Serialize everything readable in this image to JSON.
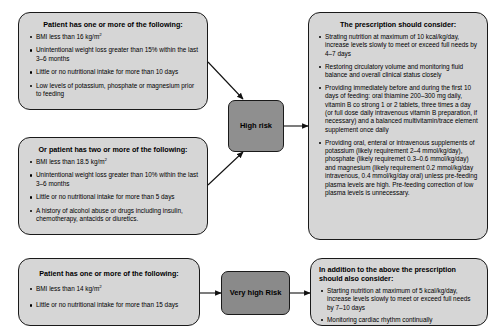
{
  "diagram": {
    "colors": {
      "criteria_box_fill": "#d6d6d6",
      "risk_box_fill": "#8f8f8f",
      "very_high_risk_box_fill": "#8a8a8a",
      "outline": "#1a1a1a",
      "text": "#000000"
    }
  },
  "high_risk_criteria_a": {
    "title": "Patient has one or more of the following:",
    "bullets": [
      "BMI less than 16 kg/m2",
      "Unintentional weight loss greater than 15% within the last 3–6 months",
      "Little or no nutritional intake for more than 10 days",
      "Low levels of potassium, phosphate or magnesium prior to feeding"
    ]
  },
  "high_risk_criteria_b": {
    "title": "Or patient has two or more of the following:",
    "bullets": [
      "BMI less than 18.5 kg/m2",
      "Unintentional weight loss greater than 10% within the last 3–6 months",
      "Little or no nutritional intake for more than 5 days",
      "A history of alcohol abuse or drugs including insulin, chemotherapy, antacids or diuretics."
    ]
  },
  "very_high_risk_criteria": {
    "title": "Patient has one or more of the following:",
    "bullets": [
      "BMI less than 14 kg/m2",
      "Little or no nutritional intake for more than 15 days"
    ]
  },
  "risk_nodes": {
    "high_risk_label": "High risk",
    "very_high_risk_label": "Very high Risk"
  },
  "prescription": {
    "title": "The prescription should consider:",
    "bullets": [
      "Strating nutrition at maximum of 10 kcal/kg/day, increase levels slowly to meet or exceed full needs by 4–7 days",
      "Restoring circulatory volume and monitoring fluid balance and overall clinical status closely",
      "Providing immediately before and during the first 10 days of feeding: oral thiamine 200–300 mg daily, vitamin B co strong 1 or 2 tablets, three times a day (or full dose daily intravenous vitamin B preparation, if necessary) and a balanced multivitamin/trace element supplement once daily",
      "Providing oral, enteral or intravenous supplements of potassium (likely requirement 2–4 mmol/kg/day), phosphate (likely requiremet 0.3–0.6 mmol/kg/day) and magnesium (likely requirement 0.2 mmol/kg/day intravenous, 0.4 mmol/kg/day oral) unless pre-feeding plasma levels are high. Pre-feeding correction of low plasma levels is unnecessary."
    ]
  },
  "prescription_additional": {
    "title": "In addition to the above the prescription should also consider:",
    "bullets": [
      "Starting nutrition at maximum of 5 kcal/kg/day, increase levels slowly to meet or exceed full needs by 7–10 days",
      "Monitoring cardiac rhythm continually"
    ]
  }
}
